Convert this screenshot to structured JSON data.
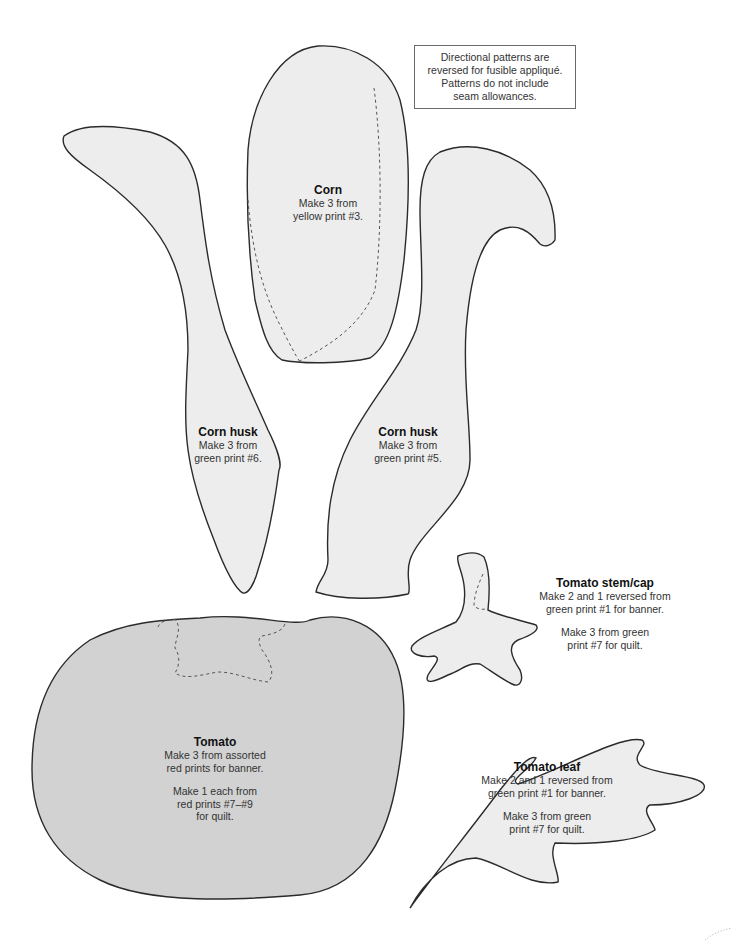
{
  "note": {
    "lines": [
      "Directional patterns are",
      "reversed for fusible appliqué.",
      "Patterns do not include",
      "seam allowances."
    ]
  },
  "colors": {
    "piece_fill": "#ededed",
    "tomato_fill": "#d2d2d2",
    "outline": "#2b2b2b",
    "dashed": "#555555"
  },
  "pieces": {
    "corn": {
      "title": "Corn",
      "lines": [
        "Make 3 from",
        "yellow print #3."
      ]
    },
    "corn_husk_left": {
      "title": "Corn husk",
      "lines": [
        "Make 3 from",
        "green print #6."
      ]
    },
    "corn_husk_right": {
      "title": "Corn husk",
      "lines": [
        "Make 3 from",
        "green print #5."
      ]
    },
    "tomato_stem_cap": {
      "title": "Tomato stem/cap",
      "lines": [
        "Make 2 and 1 reversed from",
        "green print #1 for banner."
      ],
      "lines2": [
        "Make 3 from green",
        "print #7 for quilt."
      ]
    },
    "tomato": {
      "title": "Tomato",
      "lines": [
        "Make 3 from assorted",
        "red prints for banner."
      ],
      "lines2": [
        "Make 1 each from",
        "red prints #7–#9",
        "for quilt."
      ]
    },
    "tomato_leaf": {
      "title": "Tomato leaf",
      "lines": [
        "Make 2 and 1 reversed from",
        "green print #1 for banner."
      ],
      "lines2": [
        "Make 3 from green",
        "print #7 for quilt."
      ]
    }
  }
}
